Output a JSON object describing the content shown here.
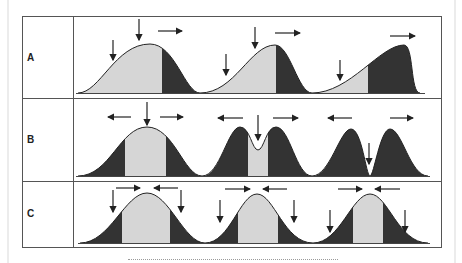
{
  "figure": {
    "colors": {
      "light_fill": "#d6d6d6",
      "dark_fill": "#333333",
      "outline": "#222222",
      "frame": "#555555"
    },
    "rows": [
      {
        "label": "A",
        "description": "Directional selection",
        "panels": [
          {
            "shape": "unimodal",
            "arrows": [
              "down",
              "down",
              "right"
            ]
          },
          {
            "shape": "right-skewed",
            "arrows": [
              "down",
              "down",
              "right"
            ]
          },
          {
            "shape": "strongly right-skewed",
            "arrows": [
              "down",
              "right"
            ]
          }
        ]
      },
      {
        "label": "B",
        "description": "Disruptive selection",
        "panels": [
          {
            "shape": "unimodal",
            "arrows": [
              "left",
              "down",
              "right"
            ]
          },
          {
            "shape": "bimodal shallow dip",
            "arrows": [
              "left",
              "down",
              "right"
            ]
          },
          {
            "shape": "bimodal deep dip",
            "arrows": [
              "left",
              "down",
              "right"
            ]
          }
        ]
      },
      {
        "label": "C",
        "description": "Stabilizing selection",
        "panels": [
          {
            "shape": "wide unimodal",
            "arrows": [
              "right",
              "left",
              "down",
              "down"
            ]
          },
          {
            "shape": "narrower unimodal",
            "arrows": [
              "right",
              "left",
              "down",
              "down"
            ]
          },
          {
            "shape": "narrowest unimodal",
            "arrows": [
              "right",
              "left",
              "down",
              "down"
            ]
          }
        ]
      }
    ]
  }
}
